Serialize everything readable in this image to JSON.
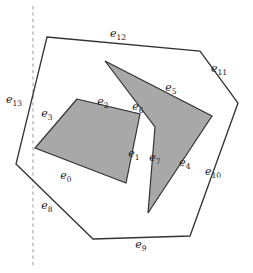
{
  "figure": {
    "type": "geometry-diagram",
    "background_color": "#ffffff",
    "stroke_color": "#333333",
    "fill_color": "#a8a8a8",
    "dashed_line_color": "#aaaaaa"
  },
  "sweep_line": {
    "orientation": "vertical",
    "style": "dashed",
    "x": 33,
    "y_start": 6,
    "y_end": 267
  },
  "outer_polygon": {
    "name": "outer-boundary",
    "fill": "none",
    "points": "47,37 200,51 238,103 190,236 93,239 16,164"
  },
  "hole_quad": {
    "name": "quadrilateral-hole",
    "fill": "#a8a8a8",
    "points": "77,99 140,114 126,183 35,148"
  },
  "hole_arrow": {
    "name": "arrow-hole",
    "fill": "#a8a8a8",
    "points": "105,61 212,116 148,213 155,127"
  },
  "labels": [
    {
      "id": "e0",
      "base": "e",
      "sub": "0",
      "x": 66,
      "y": 179
    },
    {
      "id": "e1",
      "base": "e",
      "sub": "1",
      "x": 134,
      "y": 157
    },
    {
      "id": "e2",
      "base": "e",
      "sub": "2",
      "x": 103,
      "y": 105
    },
    {
      "id": "e3",
      "base": "e",
      "sub": "3",
      "x": 47,
      "y": 117
    },
    {
      "id": "e4",
      "base": "e",
      "sub": "4",
      "x": 185,
      "y": 166
    },
    {
      "id": "e5",
      "base": "e",
      "sub": "5",
      "x": 171,
      "y": 91
    },
    {
      "id": "e6",
      "base": "e",
      "sub": "6",
      "x": 138,
      "y": 110
    },
    {
      "id": "e7",
      "base": "e",
      "sub": "7",
      "x": 155,
      "y": 161
    },
    {
      "id": "e8",
      "base": "e",
      "sub": "8",
      "x": 47,
      "y": 209
    },
    {
      "id": "e9",
      "base": "e",
      "sub": "9",
      "x": 141,
      "y": 248
    },
    {
      "id": "e10",
      "base": "e",
      "sub": "10",
      "x": 213,
      "y": 175
    },
    {
      "id": "e11",
      "base": "e",
      "sub": "11",
      "x": 219,
      "y": 72
    },
    {
      "id": "e12",
      "base": "e",
      "sub": "12",
      "x": 118,
      "y": 37
    },
    {
      "id": "e13",
      "base": "e",
      "sub": "13",
      "x": 14,
      "y": 103
    }
  ]
}
